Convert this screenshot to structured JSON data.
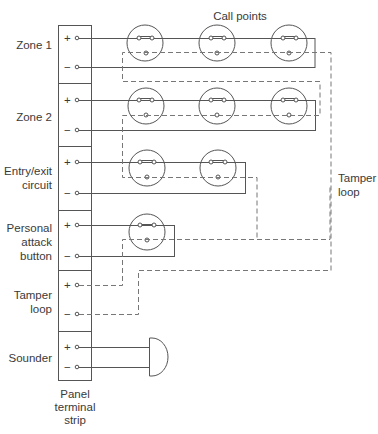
{
  "title": "Call points",
  "zones": [
    {
      "label": "Zone 1",
      "plus": "+",
      "minus": "−"
    },
    {
      "label": "Zone 2",
      "plus": "+",
      "minus": "−"
    },
    {
      "label_line1": "Entry/exit",
      "label_line2": "circuit",
      "plus": "+",
      "minus": "−"
    },
    {
      "label_line1": "Personal",
      "label_line2": "attack",
      "label_line3": "button",
      "plus": "+",
      "minus": "−"
    },
    {
      "label_line1": "Tamper",
      "label_line2": "loop",
      "plus": "+",
      "minus": "−"
    },
    {
      "label": "Sounder",
      "plus": "+",
      "minus": "−"
    }
  ],
  "tamper_label": {
    "line1": "Tamper",
    "line2": "loop"
  },
  "panel_label": {
    "line1": "Panel",
    "line2": "terminal",
    "line3": "strip"
  },
  "colors": {
    "line": "#555555",
    "dashed": "#777777",
    "text": "#3a3a3a"
  }
}
